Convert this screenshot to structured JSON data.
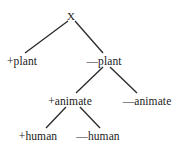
{
  "diagram": {
    "type": "binary-feature-tree",
    "background_color": "#ffffff",
    "line_color": "#2b2b2b",
    "text_color": "#1a1a1a",
    "nodes": [
      {
        "id": "root",
        "label": "X",
        "x": 71,
        "y": 16,
        "level": 0
      },
      {
        "id": "plus_plant",
        "label": "+plant",
        "x": 22,
        "y": 61,
        "level": 1
      },
      {
        "id": "minus_plant",
        "label": "—plant",
        "x": 104,
        "y": 61,
        "level": 1
      },
      {
        "id": "plus_animate",
        "label": "+animate",
        "x": 70,
        "y": 101,
        "level": 2
      },
      {
        "id": "minus_animate",
        "label": "—animate",
        "x": 147,
        "y": 101,
        "level": 2
      },
      {
        "id": "plus_human",
        "label": "+human",
        "x": 38,
        "y": 136,
        "level": 3
      },
      {
        "id": "minus_human",
        "label": "—human",
        "x": 98,
        "y": 136,
        "level": 3
      }
    ],
    "edges": [
      {
        "from": "root",
        "to": "plus_plant",
        "x1": 68,
        "y1": 21,
        "x2": 25,
        "y2": 53
      },
      {
        "from": "root",
        "to": "minus_plant",
        "x1": 75,
        "y1": 21,
        "x2": 103,
        "y2": 53
      },
      {
        "from": "minus_plant",
        "to": "plus_animate",
        "x1": 103,
        "y1": 67,
        "x2": 76,
        "y2": 93
      },
      {
        "from": "minus_plant",
        "to": "minus_animate",
        "x1": 110,
        "y1": 67,
        "x2": 137,
        "y2": 93
      },
      {
        "from": "plus_animate",
        "to": "plus_human",
        "x1": 66,
        "y1": 107,
        "x2": 46,
        "y2": 128
      },
      {
        "from": "plus_animate",
        "to": "minus_human",
        "x1": 80,
        "y1": 107,
        "x2": 100,
        "y2": 128
      }
    ]
  }
}
